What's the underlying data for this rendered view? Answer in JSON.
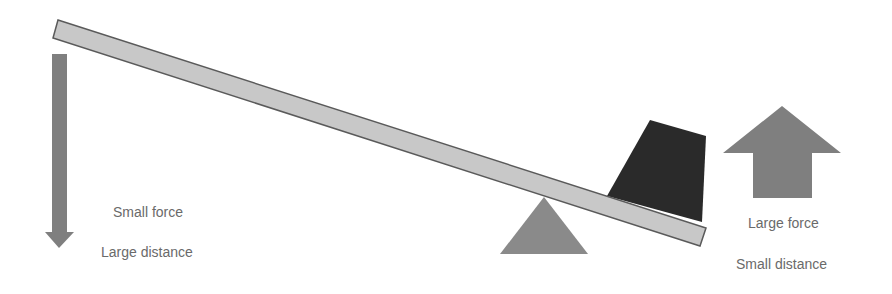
{
  "diagram": {
    "type": "lever",
    "colors": {
      "background": "#ffffff",
      "lever_fill": "#c8c8c8",
      "lever_stroke": "#5a5a5a",
      "arrow_fill": "#7f7f7f",
      "fulcrum_fill": "#8a8a8a",
      "weight_fill": "#2a2a2a",
      "text": "#6a6a6a"
    },
    "left": {
      "arrow_direction": "down",
      "line1": "Small force",
      "line2": "Large distance"
    },
    "right": {
      "arrow_direction": "up",
      "line1": "Large force",
      "line2": "Small distance"
    }
  }
}
